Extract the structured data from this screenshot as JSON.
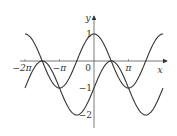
{
  "figure": {
    "title": "",
    "axes": {
      "x_label": "x",
      "y_label": "y",
      "origin_label": "0",
      "x_ticks": [
        {
          "value": -6.2832,
          "label": "−2π"
        },
        {
          "value": -3.1416,
          "label": "−π"
        },
        {
          "value": 3.1416,
          "label": "π"
        }
      ],
      "y_ticks": [
        {
          "value": 1,
          "label": "1"
        },
        {
          "value": -1,
          "label": "−1"
        },
        {
          "value": -2,
          "label": "−2"
        }
      ]
    },
    "curves": [
      {
        "name": "y = cos x",
        "expr": "cos",
        "color": "#333333"
      },
      {
        "name": "y = sin x − 1",
        "expr": "sinm1",
        "color": "#333333"
      }
    ],
    "x_range": [
      -6.2832,
      6.2832
    ],
    "y_range": [
      -2,
      1
    ]
  }
}
